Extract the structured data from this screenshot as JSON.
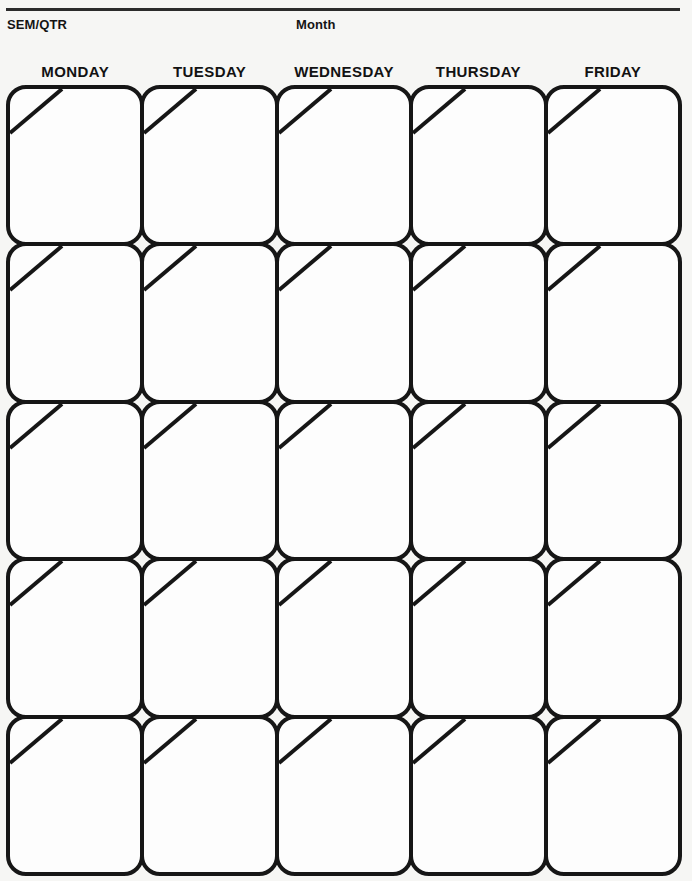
{
  "document": {
    "type": "monthly-calendar-template",
    "orientation": "portrait"
  },
  "header": {
    "sem_qtr_label": "SEM/QTR",
    "month_label": "Month"
  },
  "weekdays": [
    {
      "label": "MONDAY"
    },
    {
      "label": "TUESDAY"
    },
    {
      "label": "WEDNESDAY"
    },
    {
      "label": "THURSDAY"
    },
    {
      "label": "FRIDAY"
    }
  ],
  "grid": {
    "rows": 5,
    "columns": 5,
    "cells": [
      {
        "date": "",
        "notes": ""
      },
      {
        "date": "",
        "notes": ""
      },
      {
        "date": "",
        "notes": ""
      },
      {
        "date": "",
        "notes": ""
      },
      {
        "date": "",
        "notes": ""
      },
      {
        "date": "",
        "notes": ""
      },
      {
        "date": "",
        "notes": ""
      },
      {
        "date": "",
        "notes": ""
      },
      {
        "date": "",
        "notes": ""
      },
      {
        "date": "",
        "notes": ""
      },
      {
        "date": "",
        "notes": ""
      },
      {
        "date": "",
        "notes": ""
      },
      {
        "date": "",
        "notes": ""
      },
      {
        "date": "",
        "notes": ""
      },
      {
        "date": "",
        "notes": ""
      },
      {
        "date": "",
        "notes": ""
      },
      {
        "date": "",
        "notes": ""
      },
      {
        "date": "",
        "notes": ""
      },
      {
        "date": "",
        "notes": ""
      },
      {
        "date": "",
        "notes": ""
      },
      {
        "date": "",
        "notes": ""
      },
      {
        "date": "",
        "notes": ""
      },
      {
        "date": "",
        "notes": ""
      },
      {
        "date": "",
        "notes": ""
      },
      {
        "date": "",
        "notes": ""
      }
    ]
  },
  "colors": {
    "page_background": "#f6f6f4",
    "cell_background": "#fdfdfd",
    "ink": "#161616",
    "rule": "#2b2b2b"
  }
}
